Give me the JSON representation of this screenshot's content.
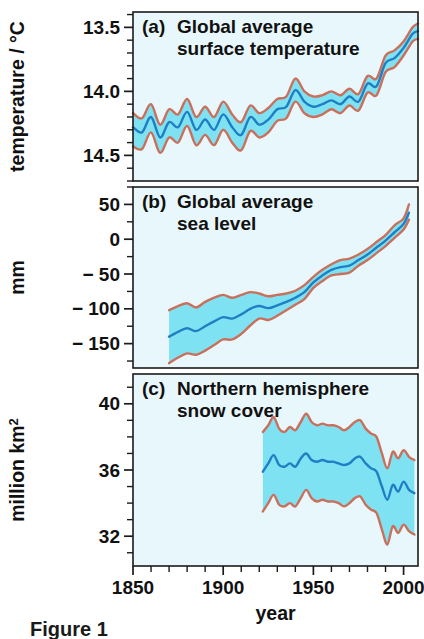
{
  "figure": {
    "x_axis_title": "year",
    "caption_fragment": "Figure 1",
    "panels": [
      {
        "key": "temperature",
        "label": "(a)",
        "title_line1": "Global average",
        "title_line2": "surface temperature",
        "y_axis_title": "temperature / °C",
        "y_ticks": [
          "14.5",
          "14.0",
          "13.5"
        ]
      },
      {
        "key": "sea_level",
        "label": "(b)",
        "title_line1": "Global average",
        "title_line2": "sea level",
        "y_axis_title": "mm",
        "y_ticks": [
          "50",
          "0",
          "− 50",
          "− 100",
          "− 150"
        ]
      },
      {
        "key": "snow_cover",
        "label": "(c)",
        "title_line1": "Northern hemisphere",
        "title_line2": "snow cover",
        "y_axis_title_main": "million km",
        "y_axis_title_sup": "2",
        "y_ticks": [
          "40",
          "36",
          "32"
        ]
      }
    ],
    "x_ticks": [
      "1850",
      "1900",
      "1950",
      "2000"
    ],
    "colors": {
      "panel_background": "#e8f7fb",
      "uncertainty_band": "#7fe2f2",
      "uncertainty_edge": "#c9705c",
      "center_line": "#1f7fc4",
      "axis": "#1b1b1b",
      "page_background": "#ffffff"
    }
  },
  "chart_data": [
    {
      "type": "line",
      "panel": "a",
      "title": "Global average surface temperature",
      "xlabel": "year",
      "ylabel": "temperature / °C",
      "xlim": [
        1850,
        2008
      ],
      "ylim": [
        13.3,
        14.62
      ],
      "yticks": [
        13.5,
        14.0,
        14.5
      ],
      "xticks": [
        1850,
        1900,
        1950,
        2000
      ],
      "minor_ytick_step": 0.1,
      "minor_xtick_step": 10,
      "grid": false,
      "legend": "none",
      "x": [
        1850,
        1855,
        1860,
        1865,
        1870,
        1875,
        1880,
        1885,
        1890,
        1895,
        1900,
        1905,
        1910,
        1915,
        1920,
        1925,
        1930,
        1935,
        1940,
        1945,
        1950,
        1955,
        1960,
        1965,
        1970,
        1975,
        1980,
        1985,
        1990,
        1995,
        2000,
        2005,
        2008
      ],
      "series": [
        {
          "name": "central estimate",
          "values": [
            13.72,
            13.68,
            13.8,
            13.64,
            13.76,
            13.72,
            13.84,
            13.7,
            13.78,
            13.7,
            13.82,
            13.72,
            13.66,
            13.8,
            13.74,
            13.78,
            13.86,
            13.88,
            14.01,
            13.92,
            13.88,
            13.9,
            13.93,
            13.9,
            13.96,
            13.92,
            14.06,
            14.04,
            14.22,
            14.26,
            14.34,
            14.45,
            14.47
          ]
        },
        {
          "name": "upper uncertainty bound",
          "values": [
            13.83,
            13.79,
            13.9,
            13.74,
            13.86,
            13.82,
            13.94,
            13.8,
            13.88,
            13.8,
            13.92,
            13.82,
            13.76,
            13.89,
            13.83,
            13.87,
            13.94,
            13.96,
            14.1,
            14.0,
            13.96,
            13.97,
            14.0,
            13.97,
            14.02,
            13.98,
            14.12,
            14.1,
            14.28,
            14.32,
            14.39,
            14.5,
            14.53
          ]
        },
        {
          "name": "lower uncertainty bound",
          "values": [
            13.57,
            13.55,
            13.68,
            13.52,
            13.64,
            13.6,
            13.73,
            13.58,
            13.66,
            13.58,
            13.7,
            13.6,
            13.54,
            13.69,
            13.64,
            13.68,
            13.77,
            13.79,
            13.92,
            13.83,
            13.8,
            13.82,
            13.86,
            13.83,
            13.89,
            13.85,
            13.99,
            13.97,
            14.15,
            14.19,
            14.28,
            14.39,
            14.41
          ]
        }
      ]
    },
    {
      "type": "line",
      "panel": "b",
      "title": "Global average sea level",
      "xlabel": "year",
      "ylabel": "mm",
      "xlim": [
        1850,
        2008
      ],
      "ylim": [
        -185,
        75
      ],
      "yticks": [
        50,
        0,
        -50,
        -100,
        -150
      ],
      "xticks": [
        1850,
        1900,
        1950,
        2000
      ],
      "minor_ytick_step": 25,
      "minor_xtick_step": 10,
      "grid": false,
      "legend": "none",
      "data_start_year": 1870,
      "x": [
        1870,
        1875,
        1880,
        1885,
        1890,
        1895,
        1900,
        1905,
        1910,
        1915,
        1920,
        1925,
        1930,
        1935,
        1940,
        1945,
        1950,
        1955,
        1960,
        1965,
        1970,
        1975,
        1980,
        1985,
        1990,
        1995,
        2000,
        2003
      ],
      "series": [
        {
          "name": "central estimate",
          "values": [
            -140,
            -133,
            -128,
            -132,
            -125,
            -118,
            -112,
            -114,
            -108,
            -100,
            -96,
            -99,
            -95,
            -90,
            -84,
            -76,
            -62,
            -52,
            -44,
            -40,
            -38,
            -30,
            -22,
            -12,
            -2,
            10,
            22,
            38
          ]
        },
        {
          "name": "upper uncertainty bound",
          "values": [
            -102,
            -96,
            -92,
            -98,
            -90,
            -84,
            -80,
            -84,
            -80,
            -76,
            -78,
            -82,
            -80,
            -78,
            -74,
            -66,
            -54,
            -44,
            -36,
            -30,
            -28,
            -22,
            -14,
            -4,
            6,
            20,
            30,
            50
          ]
        },
        {
          "name": "lower uncertainty bound",
          "values": [
            -178,
            -170,
            -164,
            -166,
            -160,
            -152,
            -144,
            -144,
            -136,
            -124,
            -114,
            -116,
            -110,
            -102,
            -94,
            -86,
            -70,
            -60,
            -52,
            -50,
            -48,
            -38,
            -30,
            -20,
            -10,
            2,
            14,
            28
          ]
        }
      ]
    },
    {
      "type": "line",
      "panel": "c",
      "title": "Northern hemisphere snow cover",
      "xlabel": "year",
      "ylabel": "million km2",
      "xlim": [
        1850,
        2008
      ],
      "ylim": [
        30.2,
        41.8
      ],
      "yticks": [
        40,
        36,
        32
      ],
      "xticks": [
        1850,
        1900,
        1950,
        2000
      ],
      "minor_ytick_step": 1,
      "minor_xtick_step": 10,
      "grid": false,
      "legend": "none",
      "data_start_year": 1922,
      "x": [
        1922,
        1925,
        1928,
        1931,
        1934,
        1937,
        1940,
        1943,
        1946,
        1949,
        1952,
        1955,
        1958,
        1961,
        1964,
        1967,
        1970,
        1973,
        1976,
        1979,
        1982,
        1985,
        1988,
        1991,
        1994,
        1997,
        2000,
        2003,
        2006
      ],
      "series": [
        {
          "name": "central estimate",
          "values": [
            35.9,
            36.4,
            36.9,
            36.3,
            36.2,
            36.4,
            36.2,
            36.7,
            37.0,
            36.6,
            36.5,
            36.6,
            36.5,
            36.5,
            36.4,
            36.3,
            36.4,
            36.7,
            36.8,
            36.4,
            36.1,
            35.9,
            35.0,
            34.2,
            35.1,
            34.7,
            35.3,
            34.8,
            34.6
          ]
        },
        {
          "name": "upper uncertainty bound",
          "values": [
            38.3,
            38.7,
            39.2,
            38.5,
            38.3,
            38.6,
            38.4,
            38.9,
            39.4,
            38.9,
            38.7,
            38.8,
            38.7,
            38.7,
            38.6,
            38.4,
            38.6,
            38.9,
            39.0,
            38.5,
            38.2,
            38.0,
            37.0,
            36.1,
            37.1,
            36.7,
            37.2,
            36.8,
            36.6
          ]
        },
        {
          "name": "lower uncertainty bound",
          "values": [
            33.5,
            34.0,
            34.5,
            33.9,
            33.8,
            34.0,
            33.8,
            34.3,
            34.8,
            34.3,
            34.1,
            34.2,
            34.1,
            34.1,
            34.0,
            33.8,
            34.0,
            34.3,
            34.4,
            33.9,
            33.6,
            33.4,
            32.4,
            31.5,
            32.6,
            32.2,
            32.7,
            32.3,
            32.1
          ]
        }
      ]
    }
  ]
}
